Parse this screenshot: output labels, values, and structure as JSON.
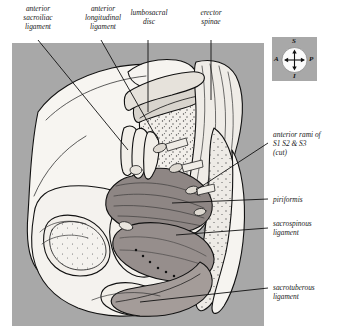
{
  "figure": {
    "panel_color": "#a8a8a8",
    "bone_color": "#f4f2ee",
    "muscle_color": "#9a9290",
    "line_color": "#111111"
  },
  "compass": {
    "name": "orientation-compass",
    "superior": "S",
    "inferior": "I",
    "anterior": "A",
    "posterior": "P"
  },
  "labels": {
    "top": [
      {
        "id": "anterior-sacroiliac-ligament",
        "text": "anterior\nsacroiliac\nligament"
      },
      {
        "id": "anterior-longitudinal-ligament",
        "text": "anterior\nlongitudinal\nligament"
      },
      {
        "id": "lumbosacral-disc",
        "text": "lumbosacral\ndisc"
      },
      {
        "id": "erector-spinae",
        "text": "erector\nspinae"
      }
    ],
    "right": [
      {
        "id": "anterior-rami-s1-s2-s3",
        "text": "anterior rami of\nS1 S2 & S3\n(cut)"
      },
      {
        "id": "piriformis",
        "text": "piriformis"
      },
      {
        "id": "sacrospinous-ligament",
        "text": "sacrospinous\nligament"
      },
      {
        "id": "sacrotuberous-ligament",
        "text": "sacrotuberous\nligament"
      }
    ]
  }
}
